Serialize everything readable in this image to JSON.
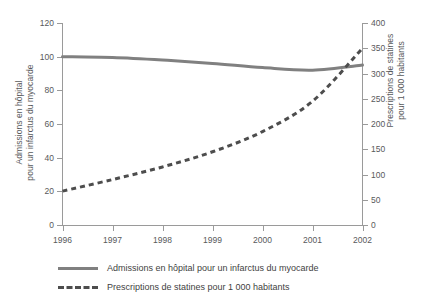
{
  "chart_data": {
    "type": "line",
    "title": "",
    "xlabel": "",
    "x": [
      1996,
      1997,
      1998,
      1999,
      2000,
      2001,
      2002
    ],
    "xticklabels": [
      "1996",
      "1997",
      "1998",
      "1999",
      "2000",
      "2001",
      "2002"
    ],
    "xlim": [
      1996,
      2002
    ],
    "grid": false,
    "legend_position": "bottom-left",
    "axes": {
      "left": {
        "label_line1": "Admissions en hôpital",
        "label_line2": "pour un infarctus du myocarde",
        "ylim": [
          0,
          120
        ],
        "ticks": [
          0,
          20,
          40,
          60,
          80,
          100,
          120
        ],
        "ticklabels": [
          "0",
          "20",
          "40",
          "60",
          "80",
          "100",
          "120"
        ]
      },
      "right": {
        "label_line1": "Prescriptions de statines",
        "label_line2": "pour 1 000 habitants",
        "ylim": [
          0,
          400
        ],
        "ticks": [
          0,
          50,
          100,
          150,
          200,
          250,
          300,
          350,
          400
        ],
        "ticklabels": [
          "0",
          "50",
          "100",
          "150",
          "200",
          "250",
          "300",
          "350",
          "400"
        ]
      }
    },
    "series": [
      {
        "name": "Admissions en hôpital pour un infarctus du myocarde",
        "axis": "left",
        "style": "solid",
        "color": "#808080",
        "values": [
          100,
          99.5,
          98,
          96,
          93.5,
          92,
          95
        ]
      },
      {
        "name": "Prescriptions de statines pour 1 000 habitants",
        "axis": "right",
        "style": "dashed",
        "color": "#4d4d4d",
        "values": [
          67,
          90,
          115,
          145,
          185,
          245,
          350
        ]
      }
    ]
  },
  "legend": {
    "items": [
      {
        "label": "Admissions en hôpital pour un infarctus du myocarde",
        "style": "solid",
        "color": "#808080"
      },
      {
        "label": "Prescriptions de statines pour 1 000 habitants",
        "style": "dashed",
        "color": "#4d4d4d"
      }
    ]
  }
}
